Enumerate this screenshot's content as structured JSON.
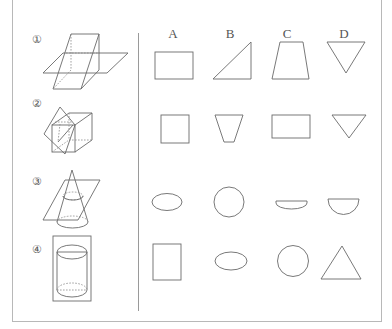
{
  "problem": {
    "solids": [
      {
        "label": "①",
        "description": "prism cut by horizontal plane"
      },
      {
        "label": "②",
        "description": "cube cut by oblique plane"
      },
      {
        "label": "③",
        "description": "cone cut by oblique plane"
      },
      {
        "label": "④",
        "description": "cylinder cut by vertical plane"
      }
    ],
    "columns": [
      "A",
      "B",
      "C",
      "D"
    ],
    "options": [
      [
        "rectangle",
        "right triangle",
        "trapezoid",
        "inverted triangle"
      ],
      [
        "square",
        "inverted trapezoid",
        "rectangle",
        "inverted triangle"
      ],
      [
        "ellipse",
        "circle",
        "shallow semicircle",
        "semicircle"
      ],
      [
        "rectangle",
        "ellipse",
        "circle",
        "triangle"
      ]
    ]
  },
  "colors": {
    "stroke": "#6a6a6a",
    "frame": "#b8b8b8"
  }
}
